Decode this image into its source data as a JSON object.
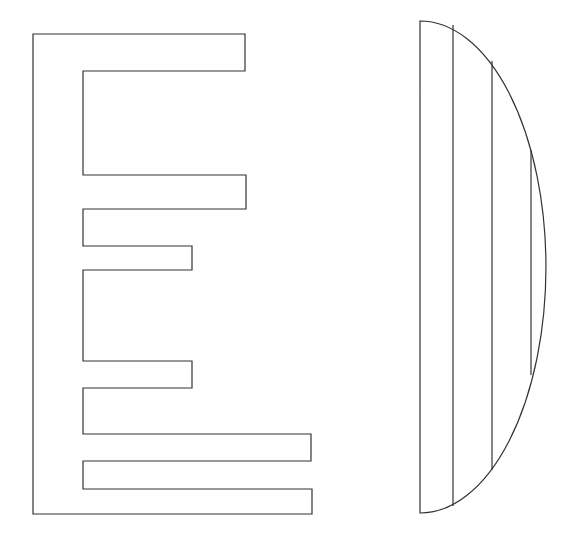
{
  "canvas": {
    "width": 567,
    "height": 543,
    "background": "#ffffff",
    "stroke_color": "#333333"
  },
  "comb_shape": {
    "description": "E-shaped comb outline with six teeth",
    "spine": {
      "left_x": 33,
      "inner_x": 83,
      "top_y": 34,
      "bottom_y": 514
    },
    "teeth": [
      {
        "top": 34,
        "bottom": 71,
        "right": 245
      },
      {
        "top": 175,
        "bottom": 209,
        "right": 246
      },
      {
        "top": 246,
        "bottom": 270,
        "right": 192
      },
      {
        "top": 361,
        "bottom": 388,
        "right": 192
      },
      {
        "top": 434,
        "bottom": 461,
        "right": 311
      },
      {
        "top": 489,
        "bottom": 514,
        "right": 312
      }
    ]
  },
  "half_ellipse_shape": {
    "description": "Half-ellipse (D shape) with vertical chords",
    "left_x": 420,
    "top_y": 21,
    "bottom_y": 513,
    "right_x": 546,
    "chords": [
      {
        "x": 453,
        "y1": 25,
        "y2": 506
      },
      {
        "x": 492,
        "y1": 61,
        "y2": 470
      },
      {
        "x": 531,
        "y1": 150,
        "y2": 375
      }
    ]
  }
}
